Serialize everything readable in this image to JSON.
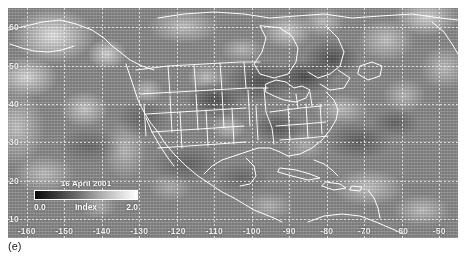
{
  "figure": {
    "panel_label": "(e)",
    "background_color": "#ffffff"
  },
  "map": {
    "region": "North America",
    "projection_note": "cylindrical lat/lon",
    "grid": true,
    "grid_color": "#ebebeb",
    "coastline_color": "#ffffff",
    "state_border_color": "#f2f2f2",
    "x_ticks": [
      "-160",
      "-150",
      "-140",
      "-130",
      "-120",
      "-110",
      "-100",
      "-90",
      "-80",
      "-70",
      "-60",
      "-50"
    ],
    "y_ticks": [
      "60",
      "50",
      "40",
      "30",
      "20",
      "10"
    ],
    "xlim": [
      -165,
      -45
    ],
    "ylim": [
      5,
      65
    ]
  },
  "legend": {
    "date": "16 April 2001",
    "title": "Index",
    "min_label": "0.0",
    "max_label": "2.0",
    "ramp_low_color": "#0a0a0a",
    "ramp_high_color": "#ffffff"
  },
  "chart_data": {
    "type": "heatmap",
    "title": "16 April 2001",
    "xlabel": "",
    "ylabel": "",
    "colorbar_label": "Index",
    "colorbar_range": [
      0.0,
      2.0
    ],
    "colormap": "grayscale",
    "xlim": [
      -165,
      -45
    ],
    "ylim": [
      5,
      65
    ],
    "xticks": [
      -160,
      -150,
      -140,
      -130,
      -120,
      -110,
      -100,
      -90,
      -80,
      -70,
      -60,
      -50
    ],
    "yticks": [
      60,
      50,
      40,
      30,
      20,
      10
    ],
    "grid": true,
    "legend_position": "lower-left-inset",
    "annotations": [
      "(e)"
    ]
  }
}
